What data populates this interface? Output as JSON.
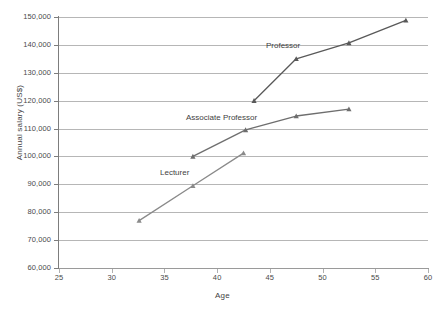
{
  "chart_data": {
    "type": "line",
    "title": "",
    "xlabel": "Age",
    "ylabel": "Annual salary (US$)",
    "xlim": [
      25,
      60
    ],
    "ylim": [
      60000,
      150000
    ],
    "xticks": [
      "25",
      "30",
      "35",
      "40",
      "45",
      "50",
      "55",
      "60"
    ],
    "yticks": [
      "60,000",
      "70,000",
      "80,000",
      "90,000",
      "100,000",
      "110,000",
      "120,000",
      "130,000",
      "140,000",
      "150,000"
    ],
    "grid": true,
    "legend_position": "inline-annotations",
    "series": [
      {
        "name": "Professor",
        "color": "#595959",
        "marker": "triangle",
        "points": [
          {
            "x": 43.5,
            "y": 120000
          },
          {
            "x": 47.5,
            "y": 135000
          },
          {
            "x": 52.5,
            "y": 140700
          },
          {
            "x": 57.9,
            "y": 148800
          }
        ]
      },
      {
        "name": "Associate Professor",
        "color": "#6e6e6e",
        "marker": "triangle",
        "points": [
          {
            "x": 37.7,
            "y": 100000
          },
          {
            "x": 42.7,
            "y": 109500
          },
          {
            "x": 47.5,
            "y": 114500
          },
          {
            "x": 52.5,
            "y": 117000
          }
        ]
      },
      {
        "name": "Lecturer",
        "color": "#8a8a8a",
        "marker": "triangle",
        "points": [
          {
            "x": 32.6,
            "y": 77000
          },
          {
            "x": 37.7,
            "y": 89500
          },
          {
            "x": 42.5,
            "y": 101200
          }
        ]
      }
    ]
  },
  "axes": {
    "x_title": "Age",
    "y_title": "Annual salary (US$)"
  },
  "annotations": {
    "professor": "Professor",
    "associate_professor": "Associate Professor",
    "lecturer": "Lecturer"
  }
}
